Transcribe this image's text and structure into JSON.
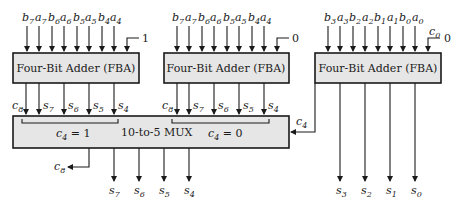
{
  "diagram": {
    "adders": [
      {
        "id": "fba-high-c1",
        "label": "Four-Bit Adder (FBA)",
        "inputs": [
          "b7",
          "a7",
          "b6",
          "a6",
          "b5",
          "a5",
          "b4",
          "a4"
        ],
        "carry_in": "1",
        "outputs": [
          "c8",
          "s7",
          "s6",
          "s5",
          "s4"
        ]
      },
      {
        "id": "fba-high-c0",
        "label": "Four-Bit Adder (FBA)",
        "inputs": [
          "b7",
          "a7",
          "b6",
          "a6",
          "b5",
          "a5",
          "b4",
          "a4"
        ],
        "carry_in": "0",
        "outputs": [
          "c8",
          "s7",
          "s6",
          "s5",
          "s4"
        ]
      },
      {
        "id": "fba-low",
        "label": "Four-Bit Adder (FBA)",
        "inputs": [
          "b3",
          "a3",
          "b2",
          "a2",
          "b1",
          "a1",
          "b0",
          "a0"
        ],
        "carry_in_label": "c0",
        "carry_in": "0",
        "outputs": [
          "c4",
          "s3",
          "s2",
          "s1",
          "s0"
        ]
      }
    ],
    "mux": {
      "label": "10-to-5 MUX",
      "group_left": "c4 = 1",
      "group_right": "c4 = 0",
      "select": "c4",
      "outputs": [
        "c8",
        "s7",
        "s6",
        "s5",
        "s4"
      ]
    },
    "final_outputs": [
      "s3",
      "s2",
      "s1",
      "s0"
    ]
  }
}
